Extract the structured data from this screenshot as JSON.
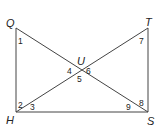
{
  "diagram": {
    "type": "geometry",
    "points": {
      "Q": {
        "label": "Q",
        "x": 16,
        "y": 28
      },
      "T": {
        "label": "T",
        "x": 148,
        "y": 28
      },
      "H": {
        "label": "H",
        "x": 16,
        "y": 112
      },
      "S": {
        "label": "S",
        "x": 148,
        "y": 112
      },
      "U": {
        "label": "U",
        "x": 80,
        "y": 70
      }
    },
    "segments": [
      {
        "from": "Q",
        "to": "H"
      },
      {
        "from": "T",
        "to": "S"
      },
      {
        "from": "H",
        "to": "S"
      },
      {
        "from": "Q",
        "to": "S"
      },
      {
        "from": "H",
        "to": "T"
      }
    ],
    "angles": [
      {
        "label": "1",
        "at": "Q"
      },
      {
        "label": "2",
        "at": "H"
      },
      {
        "label": "3",
        "at": "H"
      },
      {
        "label": "4",
        "at": "U"
      },
      {
        "label": "5",
        "at": "U"
      },
      {
        "label": "6",
        "at": "U"
      },
      {
        "label": "7",
        "at": "T"
      },
      {
        "label": "8",
        "at": "S"
      },
      {
        "label": "9",
        "at": "S"
      }
    ],
    "colors": {
      "line": "#444444",
      "text": "#222222",
      "background": "#ffffff"
    }
  }
}
